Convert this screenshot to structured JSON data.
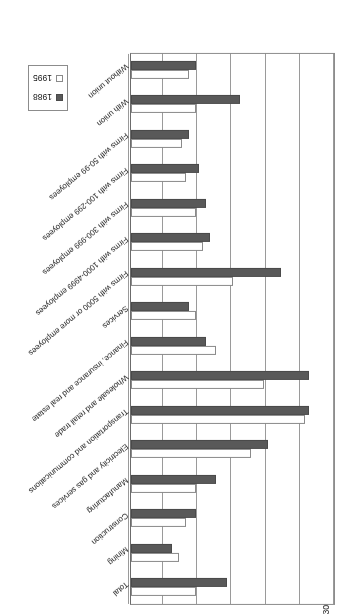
{
  "chart_data": {
    "type": "bar",
    "title": "",
    "orientation": "horizontal",
    "xlabel": "",
    "ylabel": "Average number",
    "axis_label": "Average number",
    "xlim": [
      0,
      30
    ],
    "tick_labels": [
      "0",
      "5",
      "10",
      "15",
      "20",
      "25",
      "30"
    ],
    "tick_values": [
      0,
      5,
      10,
      15,
      20,
      25,
      30
    ],
    "grid": true,
    "legend_position": "bottom-right",
    "rotation_note": "figure printed upside-down (180 degrees)",
    "categories": [
      "Total",
      "Mining",
      "Construction",
      "Manufacturing",
      "Electricity and gas services",
      "Transportation and communications",
      "Wholesale and retail trade",
      "Finance, insurance and real estate",
      "Services",
      "Firms with 5000 or more employees",
      "Firms with 1000-4999 employees",
      "Firms with 300-999 employees",
      "Firms with 100-299 employees",
      "Firms with 50-99 employees",
      "With union",
      "Without union"
    ],
    "series": [
      {
        "name": "1988",
        "color": "#595959",
        "values": [
          14,
          6,
          9.5,
          12.5,
          20,
          26,
          26,
          11,
          8.5,
          22,
          11.5,
          11,
          10,
          8.5,
          16,
          9.5
        ]
      },
      {
        "name": "1995",
        "color": "#ffffff",
        "values": [
          9.5,
          7,
          8,
          9.5,
          17.5,
          25.5,
          19.5,
          12.5,
          9.5,
          15,
          10.5,
          9.5,
          8,
          7.5,
          9.5,
          8.5
        ]
      }
    ],
    "legend": [
      "1988",
      "1995"
    ]
  }
}
